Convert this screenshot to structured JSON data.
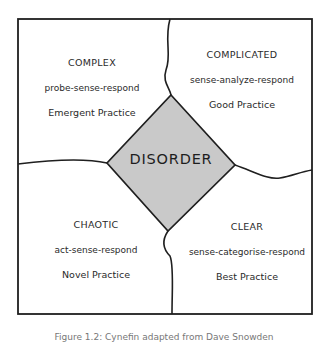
{
  "diagram": {
    "type": "cynefin-framework",
    "colors": {
      "stroke": "#1f1f1f",
      "disorder_fill": "#c9c9c9",
      "background": "#ffffff"
    },
    "domains": {
      "complex": {
        "title": "COMPLEX",
        "approach": "probe-sense-respond",
        "practice": "Emergent Practice"
      },
      "complicated": {
        "title": "COMPLICATED",
        "approach": "sense-analyze-respond",
        "practice": "Good Practice"
      },
      "chaotic": {
        "title": "CHAOTIC",
        "approach": "act-sense-respond",
        "practice": "Novel Practice"
      },
      "clear": {
        "title": "CLEAR",
        "approach": "sense-categorise-respond",
        "practice": "Best Practice"
      }
    },
    "center": {
      "title": "DISORDER"
    },
    "caption": "Figure 1.2: Cynefin adapted from Dave Snowden"
  }
}
